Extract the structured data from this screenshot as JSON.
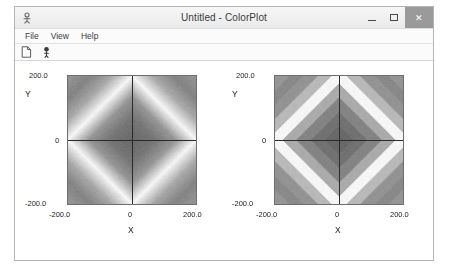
{
  "window": {
    "title": "Untitled - ColorPlot",
    "app_icon": "colorplot-app-icon",
    "controls": {
      "minimize_label": "–",
      "maximize_label": "□",
      "close_label": "✕"
    }
  },
  "menu": {
    "items": [
      {
        "label": "File"
      },
      {
        "label": "View"
      },
      {
        "label": "Help"
      }
    ]
  },
  "toolbar": {
    "buttons": [
      {
        "name": "new-document-icon",
        "label": "New"
      },
      {
        "name": "about-icon",
        "label": "About"
      }
    ]
  },
  "chart_data": [
    {
      "id": "left-plot",
      "type": "heatmap",
      "title": "",
      "xlabel": "X",
      "ylabel": "Y",
      "xlim": [
        -200.0,
        200.0
      ],
      "ylim": [
        -200.0,
        200.0
      ],
      "xticks": [
        -200.0,
        0,
        200.0
      ],
      "yticks": [
        -200.0,
        0,
        200.0
      ],
      "xticklabels": [
        "-200.0",
        "0",
        "200.0"
      ],
      "yticklabels": [
        "-200.0",
        "0",
        "200.0"
      ],
      "grid": false,
      "legend": "none",
      "colormap": "grayscale-continuous",
      "shading": "smooth",
      "levels": 0,
      "function": "f(x,y) = |x| + |y|  (diamond / L1 radius)",
      "annotation": "Continuous grayscale: dark at origin, brightening to a white ridge near |x|+|y| = 200, darkening again toward the corners.",
      "value_range": [
        0,
        400
      ],
      "ridge_value": 200,
      "axis_lines": {
        "x": 0,
        "y": 0
      },
      "gray_stops": [
        {
          "t": 0.0,
          "gray": 105
        },
        {
          "t": 0.18,
          "gray": 118
        },
        {
          "t": 0.34,
          "gray": 150
        },
        {
          "t": 0.5,
          "gray": 246
        },
        {
          "t": 0.66,
          "gray": 168
        },
        {
          "t": 0.82,
          "gray": 132
        },
        {
          "t": 1.0,
          "gray": 150
        }
      ]
    },
    {
      "id": "right-plot",
      "type": "heatmap",
      "title": "",
      "xlabel": "X",
      "ylabel": "Y",
      "xlim": [
        -200.0,
        200.0
      ],
      "ylim": [
        -200.0,
        200.0
      ],
      "xticks": [
        -200.0,
        0,
        200.0
      ],
      "yticks": [
        -200.0,
        0,
        200.0
      ],
      "xticklabels": [
        "-200.0",
        "0",
        "200.0"
      ],
      "yticklabels": [
        "-200.0",
        "0",
        "200.0"
      ],
      "grid": false,
      "legend": "none",
      "colormap": "grayscale-banded",
      "shading": "flat",
      "levels": 9,
      "function": "f(x,y) = |x| + |y|  (diamond / L1 radius)",
      "annotation": "Same diamond field quantized into discrete contour bands, producing concentric rhombic steps.",
      "value_range": [
        0,
        400
      ],
      "ridge_value": 200,
      "axis_lines": {
        "x": 0,
        "y": 0
      },
      "gray_stops": [
        {
          "t": 0.0,
          "gray": 105
        },
        {
          "t": 0.18,
          "gray": 118
        },
        {
          "t": 0.34,
          "gray": 150
        },
        {
          "t": 0.5,
          "gray": 246
        },
        {
          "t": 0.66,
          "gray": 168
        },
        {
          "t": 0.82,
          "gray": 132
        },
        {
          "t": 1.0,
          "gray": 150
        }
      ]
    }
  ]
}
